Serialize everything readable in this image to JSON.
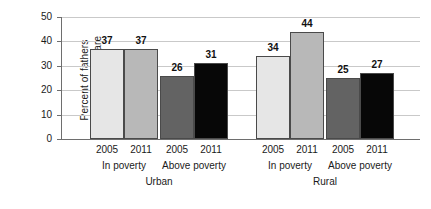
{
  "chart_data": {
    "type": "bar",
    "title": "",
    "xlabel": "",
    "ylabel": "Percent of fathers providing child care",
    "ylabel_lines": [
      "Percent of fathers",
      "providing child care"
    ],
    "ylim": [
      0,
      50
    ],
    "yticks": [
      0,
      10,
      20,
      30,
      40,
      50
    ],
    "ytick_labels": [
      "0",
      "10",
      "20",
      "30",
      "40",
      "50"
    ],
    "grid": true,
    "legend": "none",
    "categories": [
      "2005",
      "2011",
      "2005",
      "2011",
      "2005",
      "2011",
      "2005",
      "2011"
    ],
    "values": [
      37,
      37,
      26,
      31,
      34,
      44,
      25,
      27
    ],
    "bars": [
      {
        "region": "Urban",
        "group": "In poverty",
        "year": "2005",
        "value": 37,
        "color": "#e6e6e6"
      },
      {
        "region": "Urban",
        "group": "In poverty",
        "year": "2011",
        "value": 37,
        "color": "#b8b8b8"
      },
      {
        "region": "Urban",
        "group": "Above poverty",
        "year": "2005",
        "value": 26,
        "color": "#636363"
      },
      {
        "region": "Urban",
        "group": "Above poverty",
        "year": "2011",
        "value": 31,
        "color": "#070707"
      },
      {
        "region": "Rural",
        "group": "In poverty",
        "year": "2005",
        "value": 34,
        "color": "#e6e6e6"
      },
      {
        "region": "Rural",
        "group": "In poverty",
        "year": "2011",
        "value": 44,
        "color": "#b8b8b8"
      },
      {
        "region": "Rural",
        "group": "Above poverty",
        "year": "2005",
        "value": 25,
        "color": "#636363"
      },
      {
        "region": "Rural",
        "group": "Above poverty",
        "year": "2011",
        "value": 27,
        "color": "#070707"
      }
    ],
    "group_labels": [
      "In poverty",
      "Above poverty",
      "In poverty",
      "Above poverty"
    ],
    "region_labels": [
      "Urban",
      "Rural"
    ],
    "colors": {
      "bar_2005_in_poverty": "#e6e6e6",
      "bar_2011_in_poverty": "#b8b8b8",
      "bar_2005_above_poverty": "#636363",
      "bar_2011_above_poverty": "#070707",
      "gridline": "#c9c9c9",
      "axis": "#6e6e6e",
      "text": "#1a1a1a",
      "background": "#ffffff"
    }
  }
}
